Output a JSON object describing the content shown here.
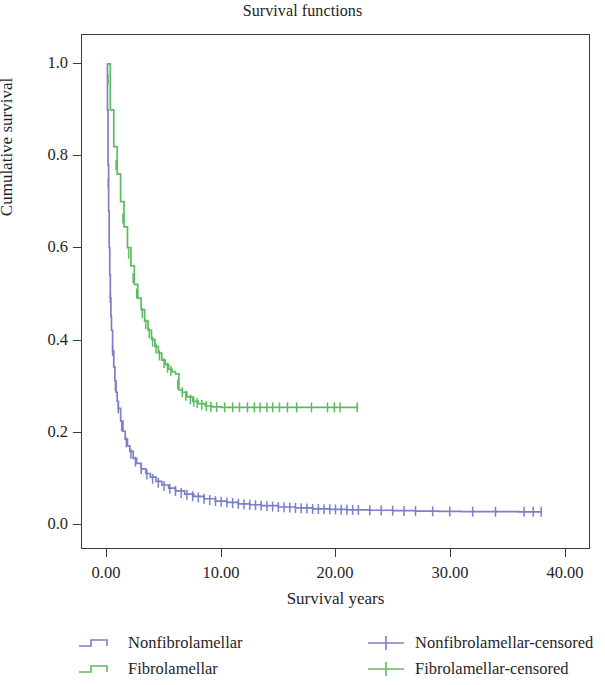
{
  "chart_data": {
    "type": "line",
    "title": "Survival functions",
    "xlabel": "Survival years",
    "ylabel": "Cumulative survival",
    "xlim": [
      -1.5,
      41.5
    ],
    "ylim": [
      -0.045,
      1.08
    ],
    "grid": false,
    "legend_position": "below-plot",
    "xticks": [
      "0.00",
      "10.00",
      "20.00",
      "30.00",
      "40.00"
    ],
    "xtick_values": [
      0,
      10,
      20,
      30,
      40
    ],
    "yticks": [
      "0.0",
      "0.2",
      "0.4",
      "0.6",
      "0.8",
      "1.0"
    ],
    "ytick_values": [
      0.0,
      0.2,
      0.4,
      0.6,
      0.8,
      1.0
    ],
    "colors": {
      "nonfibrolamellar": "#7b7fc9",
      "fibrolamellar": "#5cbb60",
      "axis": "#3a3a3a",
      "text": "#1f1f1f",
      "background": "#ffffff"
    },
    "series": [
      {
        "name": "Nonfibrolamellar",
        "color": "#7b7fc9",
        "censored_name": "Nonfibrolamellar-censored",
        "x": [
          0,
          0.05,
          0.1,
          0.15,
          0.2,
          0.25,
          0.3,
          0.35,
          0.4,
          0.5,
          0.6,
          0.7,
          0.8,
          0.9,
          1.0,
          1.2,
          1.4,
          1.6,
          1.8,
          2.0,
          2.3,
          2.6,
          3.0,
          3.4,
          3.8,
          4.3,
          4.8,
          5.4,
          6.0,
          6.8,
          7.6,
          8.5,
          9.5,
          10.5,
          11.5,
          12.5,
          13.5,
          15.0,
          16.5,
          18.0,
          19.5,
          21.0,
          23.0,
          25.0,
          27.0,
          29.0,
          31.0,
          33.5,
          36.0,
          38.0
        ],
        "y": [
          1.0,
          0.9,
          0.78,
          0.68,
          0.6,
          0.54,
          0.49,
          0.45,
          0.42,
          0.375,
          0.34,
          0.31,
          0.285,
          0.265,
          0.25,
          0.222,
          0.2,
          0.183,
          0.168,
          0.156,
          0.141,
          0.13,
          0.118,
          0.108,
          0.1,
          0.091,
          0.083,
          0.076,
          0.07,
          0.063,
          0.058,
          0.053,
          0.048,
          0.045,
          0.042,
          0.04,
          0.038,
          0.035,
          0.033,
          0.031,
          0.03,
          0.029,
          0.028,
          0.027,
          0.026,
          0.0255,
          0.025,
          0.0248,
          0.0245,
          0.0245
        ],
        "censored_x": [
          0.12,
          0.3,
          0.5,
          0.75,
          1.0,
          1.3,
          1.7,
          2.1,
          2.5,
          3.0,
          3.5,
          4.0,
          4.5,
          5.0,
          5.5,
          6.0,
          6.5,
          7.0,
          7.5,
          8.0,
          8.5,
          9.0,
          9.5,
          10.0,
          10.5,
          11.0,
          11.5,
          12.0,
          12.5,
          13.0,
          13.5,
          14.0,
          14.5,
          15.0,
          15.5,
          16.0,
          16.5,
          17.0,
          17.5,
          18.0,
          18.5,
          19.0,
          19.5,
          20.0,
          20.5,
          21.0,
          21.5,
          22.0,
          23.0,
          24.0,
          25.0,
          26.0,
          27.0,
          28.5,
          30.0,
          32.0,
          34.0,
          36.5,
          37.3,
          38.0
        ],
        "censored_count": 60
      },
      {
        "name": "Fibrolamellar",
        "color": "#5cbb60",
        "censored_name": "Fibrolamellar-censored",
        "x": [
          0,
          0.3,
          0.6,
          0.9,
          1.2,
          1.5,
          1.8,
          2.1,
          2.4,
          2.7,
          3.0,
          3.3,
          3.6,
          3.9,
          4.2,
          4.5,
          4.8,
          5.1,
          5.4,
          5.7,
          6.0,
          6.3,
          6.6,
          7.0,
          7.5,
          8.0,
          8.6,
          9.2,
          10.0,
          12.0,
          14.0,
          16.0,
          18.0,
          20.0,
          22.0
        ],
        "y": [
          1.0,
          0.9,
          0.82,
          0.76,
          0.7,
          0.645,
          0.6,
          0.56,
          0.52,
          0.49,
          0.465,
          0.44,
          0.42,
          0.4,
          0.385,
          0.37,
          0.355,
          0.345,
          0.335,
          0.33,
          0.325,
          0.29,
          0.285,
          0.275,
          0.265,
          0.26,
          0.255,
          0.253,
          0.252,
          0.252,
          0.252,
          0.252,
          0.252,
          0.252,
          0.252
        ],
        "censored_x": [
          0.1,
          0.8,
          1.4,
          1.9,
          2.3,
          2.6,
          3.1,
          3.4,
          3.7,
          4.0,
          4.3,
          4.6,
          5.0,
          5.3,
          5.6,
          6.2,
          6.6,
          6.9,
          7.3,
          7.6,
          7.9,
          8.3,
          8.7,
          9.1,
          9.6,
          10.3,
          11.0,
          11.6,
          12.3,
          12.9,
          13.4,
          14.0,
          14.5,
          15.1,
          15.8,
          16.6,
          17.9,
          19.3,
          19.9,
          20.4,
          21.9
        ],
        "censored_count": 41
      }
    ]
  },
  "legend": {
    "entries": [
      {
        "label": "Nonfibrolamellar",
        "symbol": "step-line",
        "color": "#7b7fc9"
      },
      {
        "label": "Fibrolamellar",
        "symbol": "step-line",
        "color": "#5cbb60"
      },
      {
        "label": "Nonfibrolamellar-censored",
        "symbol": "plus-marker",
        "color": "#7b7fc9"
      },
      {
        "label": "Fibrolamellar-censored",
        "symbol": "plus-marker",
        "color": "#5cbb60"
      }
    ]
  }
}
